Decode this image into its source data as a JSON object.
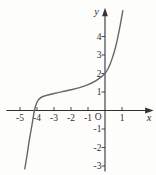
{
  "chart_data": {
    "type": "line",
    "title": "",
    "xlabel": "x",
    "ylabel": "y",
    "origin_label": "O",
    "x_ticks": [
      -5,
      -4,
      -3,
      -2,
      -1,
      1
    ],
    "y_ticks": [
      4,
      3,
      2,
      1,
      -1,
      -2,
      -3
    ],
    "xlim": [
      -5.8,
      2.8
    ],
    "ylim": [
      -3.3,
      5.5
    ],
    "grid": false,
    "legend": false,
    "axes_style": "centered-axes-with-arrows",
    "series": [
      {
        "name": "curve",
        "shape": "increasing cubic-like S curve, flat near inflection (-1.5, 1.2)",
        "x_intercept": -4.15,
        "y_intercept": 2,
        "points": [
          [
            -4.72,
            -3.15
          ],
          [
            -4.6,
            -2.5
          ],
          [
            -4.45,
            -1.6
          ],
          [
            -4.3,
            -0.8
          ],
          [
            -4.15,
            0
          ],
          [
            -4.0,
            0.45
          ],
          [
            -3.8,
            0.68
          ],
          [
            -3.5,
            0.8
          ],
          [
            -3.0,
            0.92
          ],
          [
            -2.5,
            1.02
          ],
          [
            -2.0,
            1.12
          ],
          [
            -1.5,
            1.24
          ],
          [
            -1.0,
            1.4
          ],
          [
            -0.6,
            1.58
          ],
          [
            -0.3,
            1.76
          ],
          [
            0,
            2.0
          ],
          [
            0.2,
            2.3
          ],
          [
            0.4,
            2.75
          ],
          [
            0.6,
            3.35
          ],
          [
            0.75,
            3.95
          ],
          [
            0.88,
            4.55
          ],
          [
            1.0,
            5.15
          ],
          [
            1.05,
            5.4
          ]
        ]
      }
    ],
    "colors": {
      "axis": "#333333",
      "curve": "#666666",
      "text": "#2f2f2f",
      "background": "#fdfdfc"
    }
  }
}
